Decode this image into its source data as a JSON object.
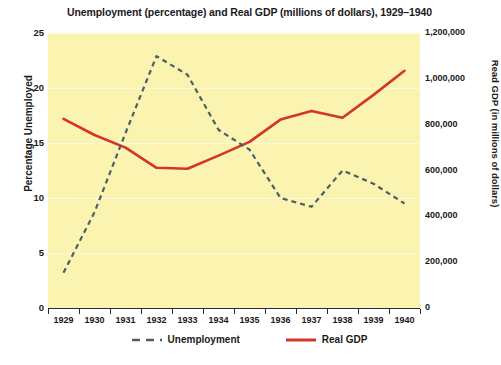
{
  "chart_data": {
    "type": "line",
    "title": "Unemployment (percentage) and Real GDP (millions of dollars), 1929–1940",
    "xlabel": "",
    "ylabel": "Percentage Unemployed",
    "y2label": "Read GDP (in millions of dollars)",
    "categories": [
      "1929",
      "1930",
      "1931",
      "1932",
      "1933",
      "1934",
      "1935",
      "1936",
      "1937",
      "1938",
      "1939",
      "1940"
    ],
    "x": [
      1929,
      1930,
      1931,
      1932,
      1933,
      1934,
      1935,
      1936,
      1937,
      1938,
      1939,
      1940
    ],
    "ylim": [
      0,
      25
    ],
    "yticks": [
      0,
      5,
      10,
      15,
      20,
      25
    ],
    "ytick_labels": [
      "0",
      "5",
      "10",
      "15",
      "20",
      "25"
    ],
    "y2lim": [
      0,
      1200000
    ],
    "y2ticks": [
      0,
      200000,
      400000,
      600000,
      800000,
      1000000,
      1200000
    ],
    "y2tick_labels": [
      "0",
      "200,000",
      "400,000",
      "600,000",
      "800,000",
      "1,000,000",
      "1,200,000"
    ],
    "grid": true,
    "legend_position": "bottom",
    "plot_background": "#faf4b0",
    "series": [
      {
        "name": "Unemployment",
        "axis": "left",
        "color": "#4a5f68",
        "style": "dashed",
        "values": [
          3.2,
          8.7,
          15.9,
          22.9,
          21.2,
          16.2,
          14.4,
          10.0,
          9.2,
          12.5,
          11.3,
          9.5
        ]
      },
      {
        "name": "Real GDP",
        "axis": "right",
        "color": "#d4342a",
        "style": "solid",
        "values": [
          825000,
          755000,
          700000,
          612000,
          608000,
          665000,
          725000,
          822000,
          860000,
          830000,
          930000,
          1035000
        ]
      }
    ]
  },
  "legend": {
    "items": [
      {
        "label": "Unemployment"
      },
      {
        "label": "Real GDP"
      }
    ]
  }
}
